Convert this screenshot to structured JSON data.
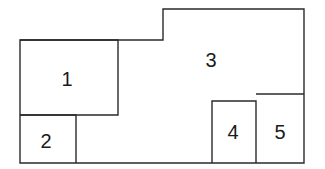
{
  "diagram": {
    "type": "floor-plan-regions",
    "regions": [
      {
        "id": "1",
        "label": "1",
        "x": 20,
        "y": 40,
        "w": 98,
        "h": 75
      },
      {
        "id": "2",
        "label": "2",
        "x": 20,
        "y": 115,
        "w": 56,
        "h": 48
      },
      {
        "id": "3",
        "label": "3",
        "note": "L-shaped region occupying remaining area"
      },
      {
        "id": "4",
        "label": "4",
        "x": 212,
        "y": 101,
        "w": 44,
        "h": 62
      },
      {
        "id": "5",
        "label": "5",
        "x": 256,
        "y": 94,
        "w": 48,
        "h": 69
      }
    ],
    "colors": {
      "stroke": "#2a2a2a",
      "background": "#ffffff",
      "text": "#1a1a1a"
    }
  }
}
